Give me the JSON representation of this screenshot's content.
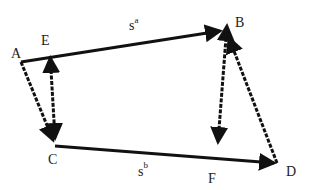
{
  "diagram": {
    "points": {
      "A": {
        "label": "A"
      },
      "B": {
        "label": "B"
      },
      "C": {
        "label": "C"
      },
      "D": {
        "label": "D"
      },
      "E": {
        "label": "E"
      },
      "F": {
        "label": "F"
      }
    },
    "edge_labels": {
      "top": {
        "base": "s",
        "sup": "a"
      },
      "bottom": {
        "base": "s",
        "sup": "b"
      }
    },
    "edges": [
      {
        "from": "A",
        "to": "B",
        "style": "solid",
        "arrow": "end"
      },
      {
        "from": "C",
        "to": "D",
        "style": "solid",
        "arrow": "end"
      },
      {
        "from": "A",
        "to": "C",
        "style": "dashed",
        "arrow": "end"
      },
      {
        "from": "E-top",
        "to": "E-bottom",
        "style": "dashed",
        "arrow": "both"
      },
      {
        "from": "B",
        "to": "F",
        "style": "dashed",
        "arrow": "both"
      },
      {
        "from": "D",
        "to": "B",
        "style": "dashed",
        "arrow": "end"
      }
    ],
    "colors": {
      "stroke": "#111111",
      "text": "#222222",
      "background": "#ffffff"
    }
  }
}
